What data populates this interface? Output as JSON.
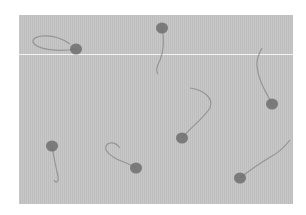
{
  "image": {
    "description": "Grayscale light micrograph of sperm cells",
    "background_color": "#c4c4c4",
    "frame_color": "#ffffff",
    "cells": [
      {
        "head": [
          76,
          49
        ],
        "tail": "M76,49 C60,52 36,50 33,42 C32,34 55,33 70,44"
      },
      {
        "head": [
          162,
          28
        ],
        "tail": "M162,28 C164,38 165,48 160,60 C156,68 156,72 158,74"
      },
      {
        "head": [
          272,
          104
        ],
        "tail": "M272,104 C266,92 258,80 257,66 C256,58 260,52 262,48"
      },
      {
        "head": [
          182,
          138
        ],
        "tail": "M182,138 C190,128 204,118 210,108 C214,98 204,90 190,88"
      },
      {
        "head": [
          52,
          146
        ],
        "tail": "M52,146 C54,158 56,168 58,176 C59,182 56,184 54,180"
      },
      {
        "head": [
          136,
          168
        ],
        "tail": "M136,168 C128,162 112,160 106,150 C104,142 114,140 120,148"
      },
      {
        "head": [
          240,
          178
        ],
        "tail": "M240,178 C250,170 262,162 272,156 C280,152 286,145 290,140"
      }
    ]
  }
}
